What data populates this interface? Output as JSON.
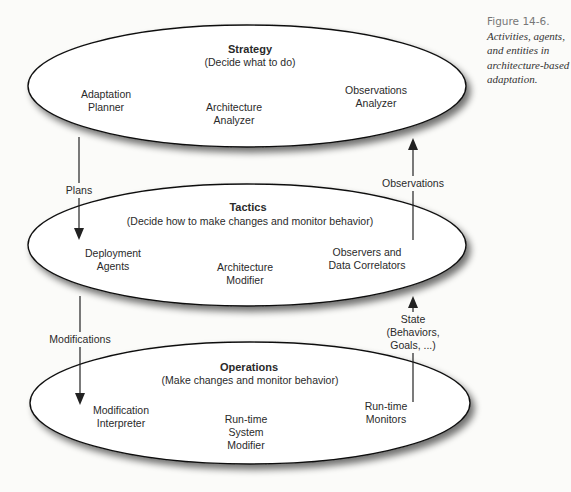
{
  "caption": {
    "number": "Figure 14-6.",
    "text": "Activities, agents, and entities in architecture-based adaptation."
  },
  "layers": [
    {
      "title": "Strategy",
      "subtitle": "(Decide what to do)",
      "entities": [
        {
          "line1": "Adaptation",
          "line2": "Planner"
        },
        {
          "line1": "Architecture",
          "line2": "Analyzer"
        },
        {
          "line1": "Observations",
          "line2": "Analyzer"
        }
      ]
    },
    {
      "title": "Tactics",
      "subtitle": "(Decide how to make changes and monitor behavior)",
      "entities": [
        {
          "line1": "Deployment",
          "line2": "Agents"
        },
        {
          "line1": "Architecture",
          "line2": "Modifier"
        },
        {
          "line1": "Observers and",
          "line2": "Data Correlators"
        }
      ]
    },
    {
      "title": "Operations",
      "subtitle": "(Make changes and monitor behavior)",
      "entities": [
        {
          "line1": "Modification",
          "line2": "Interpreter"
        },
        {
          "line1": "Run-time",
          "line2": "System",
          "line3": "Modifier"
        },
        {
          "line1": "Run-time",
          "line2": "Monitors"
        }
      ]
    }
  ],
  "flows": {
    "plans": "Plans",
    "observations": "Observations",
    "modifications": "Modifications",
    "state": {
      "line1": "State",
      "line2": "(Behaviors,",
      "line3": "Goals, ...)"
    }
  }
}
